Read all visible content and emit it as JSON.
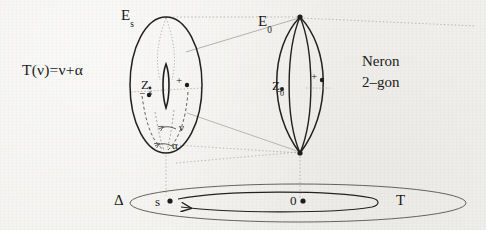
{
  "figure": {
    "title_formula": "T(ν)=ν+α",
    "caption_line1": "Neron",
    "caption_line2": "2–gon",
    "ink_color": "#1f1d1a",
    "faint_color": "#8d8b86",
    "paper_color": "#f3f2ef"
  },
  "labels": {
    "fiber_s": "E",
    "fiber_s_sub": "s",
    "fiber_0": "E",
    "fiber_0_sub": "0",
    "center_s": "Z",
    "center_s_sub": "s",
    "center_0": "Z",
    "center_0_sub": "0",
    "plus_left": "+",
    "minus_left": "−",
    "plus_right": "+",
    "minus_right": "−",
    "nu": "ν",
    "alpha": "α",
    "delta": "Δ",
    "base_s": "s",
    "base_0": "0",
    "base_T": "T"
  },
  "shapes": {
    "left_fiber_kind": "smooth-elliptic-curve-torus",
    "right_fiber_kind": "neron-2-gon-lens",
    "base_kind": "disc-delta",
    "monodromy_arrow": "loop-from-0-to-s"
  }
}
